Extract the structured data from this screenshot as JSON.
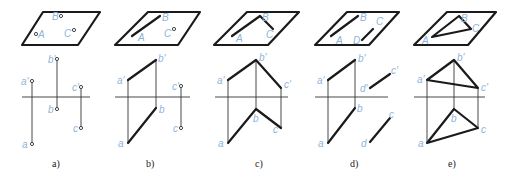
{
  "colors": {
    "line": "#1a1a1a",
    "thin_line": "#333333",
    "label": "#8fb4d9",
    "background": "#ffffff"
  },
  "panels": [
    {
      "id": "a",
      "caption": "a)",
      "description": "Three points A, B, C on a plane (not collinear) and their projections",
      "plane_labels": [
        "A",
        "B",
        "C"
      ],
      "projection_labels": {
        "a_prime": "a'",
        "b_prime": "b'",
        "c_prime": "c'",
        "a": "a",
        "b": "b",
        "c": "c"
      }
    },
    {
      "id": "b",
      "caption": "b)",
      "description": "Line AB and point C",
      "plane_labels": [
        "A",
        "B",
        "C"
      ],
      "projection_labels": {
        "a_prime": "a'",
        "b_prime": "b'",
        "c_prime": "c'",
        "a": "a",
        "b": "b",
        "c": "c"
      }
    },
    {
      "id": "c",
      "caption": "c)",
      "description": "Two intersecting lines AB and BC",
      "plane_labels": [
        "A",
        "B",
        "C"
      ],
      "projection_labels": {
        "a_prime": "a'",
        "b_prime": "b'",
        "c_prime": "c'",
        "a": "a",
        "b": "b",
        "c": "c"
      }
    },
    {
      "id": "d",
      "caption": "d)",
      "description": "Two parallel lines AB and CD",
      "plane_labels": [
        "A",
        "B",
        "C",
        "D"
      ],
      "projection_labels": {
        "a_prime": "a'",
        "b_prime": "b'",
        "c_prime": "c'",
        "d_prime": "d'",
        "a": "a",
        "b": "b",
        "c": "c",
        "d": "d"
      }
    },
    {
      "id": "e",
      "caption": "e)",
      "description": "Plane figure triangle ABC",
      "plane_labels": [
        "A",
        "B",
        "C"
      ],
      "projection_labels": {
        "a_prime": "a'",
        "b_prime": "b'",
        "c_prime": "c'",
        "a": "a",
        "b": "b",
        "c": "c"
      }
    }
  ]
}
